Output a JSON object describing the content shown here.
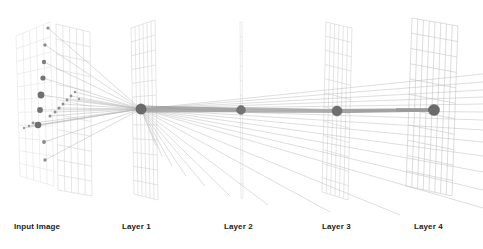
{
  "figure": {
    "background_color": "#ffffff",
    "width": 483,
    "height": 249
  },
  "style": {
    "grid_line_color_back": "#dddddd",
    "grid_line_color_front": "#cfcfcf",
    "grid_line_color_mid": "#c8c8c8",
    "ray_color": "#b4b4b4",
    "ray_color_strong": "#9a9a9a",
    "node_color": "#6e6e6e",
    "node_edge_color": "#555555",
    "dot_color_dark": "#6f6f6f",
    "dot_color_mid": "#8c8c8c",
    "dot_color_light": "#a8a8a8",
    "label_color": "#1b1b1b"
  },
  "labels": [
    {
      "id": "input-image",
      "text": "Input Image",
      "x": 14,
      "y": 222
    },
    {
      "id": "layer-1",
      "text": "Layer 1",
      "x": 122,
      "y": 222
    },
    {
      "id": "layer-2",
      "text": "Layer 2",
      "x": 224,
      "y": 222
    },
    {
      "id": "layer-3",
      "text": "Layer 3",
      "x": 322,
      "y": 222
    },
    {
      "id": "layer-4",
      "text": "Layer 4",
      "x": 414,
      "y": 222
    }
  ],
  "planes": [
    {
      "id": "input-plane-back",
      "name": "input-image-back-plane",
      "color": "#dedede",
      "stroke_width": 0.5,
      "cols": 5,
      "rows": 11,
      "top_left": [
        16,
        36
      ],
      "top_right": [
        50,
        22
      ],
      "bottom_right": [
        54,
        186
      ],
      "bottom_left": [
        20,
        176
      ]
    },
    {
      "id": "input-plane-front",
      "name": "input-image-front-plane",
      "color": "#d2d2d2",
      "stroke_width": 0.55,
      "cols": 5,
      "rows": 11,
      "top_left": [
        56,
        24
      ],
      "top_right": [
        90,
        32
      ],
      "bottom_right": [
        92,
        196
      ],
      "bottom_left": [
        58,
        190
      ]
    },
    {
      "id": "layer1-plane",
      "name": "layer-1-plane",
      "color": "#cdcdcd",
      "stroke_width": 0.5,
      "cols": 6,
      "rows": 12,
      "top_left": [
        131,
        28
      ],
      "top_right": [
        155,
        20
      ],
      "bottom_right": [
        158,
        200
      ],
      "bottom_left": [
        134,
        194
      ]
    },
    {
      "id": "layer2-plane",
      "name": "layer-2-plane",
      "color": "#d6d6d6",
      "stroke_width": 0.5,
      "cols": 1,
      "rows": 12,
      "top_left": [
        240,
        22
      ],
      "top_right": [
        242,
        22
      ],
      "bottom_right": [
        243,
        198
      ],
      "bottom_left": [
        241,
        198
      ]
    },
    {
      "id": "layer3-plane",
      "name": "layer-3-plane",
      "color": "#cbcbcb",
      "stroke_width": 0.5,
      "cols": 6,
      "rows": 12,
      "top_left": [
        326,
        22
      ],
      "top_right": [
        352,
        28
      ],
      "bottom_right": [
        348,
        200
      ],
      "bottom_left": [
        322,
        192
      ]
    },
    {
      "id": "layer4-plane",
      "name": "layer-4-plane",
      "color": "#c6c6c6",
      "stroke_width": 0.6,
      "cols": 8,
      "rows": 11,
      "top_left": [
        412,
        18
      ],
      "top_right": [
        458,
        26
      ],
      "bottom_right": [
        452,
        196
      ],
      "bottom_left": [
        406,
        186
      ]
    }
  ],
  "nodes": [
    {
      "id": "node-layer-1",
      "name": "layer-1-node",
      "x": 141,
      "y": 109,
      "r": 5.2,
      "color": "#6b6b6b"
    },
    {
      "id": "node-layer-2",
      "name": "layer-2-node",
      "x": 241,
      "y": 110,
      "r": 4.4,
      "color": "#737373"
    },
    {
      "id": "node-layer-3",
      "name": "layer-3-node",
      "x": 337,
      "y": 111,
      "r": 5.0,
      "color": "#6e6e6e"
    },
    {
      "id": "node-layer-4",
      "name": "layer-4-node",
      "x": 434,
      "y": 110,
      "r": 5.6,
      "color": "#6a6a6a"
    }
  ],
  "input_dots": [
    {
      "x": 48,
      "y": 28,
      "r": 1.6,
      "color": "#8c8c8c"
    },
    {
      "x": 45,
      "y": 45,
      "r": 1.7,
      "color": "#8c8c8c"
    },
    {
      "x": 44,
      "y": 62,
      "r": 2.2,
      "color": "#7d7d7d"
    },
    {
      "x": 43,
      "y": 78,
      "r": 2.6,
      "color": "#757575"
    },
    {
      "x": 41,
      "y": 95,
      "r": 3.4,
      "color": "#6f6f6f"
    },
    {
      "x": 40,
      "y": 110,
      "r": 2.9,
      "color": "#737373"
    },
    {
      "x": 38,
      "y": 125,
      "r": 3.3,
      "color": "#6f6f6f"
    },
    {
      "x": 44,
      "y": 142,
      "r": 1.9,
      "color": "#8a8a8a"
    },
    {
      "x": 45,
      "y": 160,
      "r": 1.7,
      "color": "#8f8f8f"
    },
    {
      "x": 24,
      "y": 128,
      "r": 1.2,
      "color": "#9d9d9d"
    },
    {
      "x": 29,
      "y": 126,
      "r": 1.3,
      "color": "#999999"
    },
    {
      "x": 33,
      "y": 123,
      "r": 1.4,
      "color": "#959595"
    },
    {
      "x": 50,
      "y": 116,
      "r": 1.5,
      "color": "#909090"
    },
    {
      "x": 55,
      "y": 112,
      "r": 1.5,
      "color": "#909090"
    },
    {
      "x": 59,
      "y": 108,
      "r": 1.6,
      "color": "#8b8b8b"
    },
    {
      "x": 63,
      "y": 104,
      "r": 1.5,
      "color": "#909090"
    },
    {
      "x": 67,
      "y": 100,
      "r": 1.4,
      "color": "#959595"
    },
    {
      "x": 71,
      "y": 96,
      "r": 1.4,
      "color": "#959595"
    },
    {
      "x": 75,
      "y": 92,
      "r": 1.3,
      "color": "#9a9a9a"
    },
    {
      "x": 79,
      "y": 99,
      "r": 1.2,
      "color": "#9d9d9d"
    }
  ],
  "ray_bundles": [
    {
      "id": "input-to-layer1",
      "name": "rays-input-to-layer-1",
      "target": [
        141,
        109
      ],
      "color": "#b0b0b0",
      "stroke_width": 0.45
    },
    {
      "id": "layer1-fan",
      "name": "rays-layer-1-fan",
      "source": [
        141,
        109
      ],
      "color": "#b6b6b6",
      "stroke_width": 0.45,
      "endpoints": [
        [
          483,
          74
        ],
        [
          483,
          82
        ],
        [
          483,
          90
        ],
        [
          483,
          97
        ],
        [
          483,
          104
        ],
        [
          483,
          112
        ],
        [
          483,
          120
        ],
        [
          483,
          130
        ],
        [
          483,
          142
        ],
        [
          483,
          156
        ],
        [
          483,
          172
        ],
        [
          483,
          190
        ],
        [
          483,
          208
        ],
        [
          400,
          215
        ],
        [
          330,
          212
        ],
        [
          268,
          205
        ],
        [
          230,
          196
        ],
        [
          205,
          186
        ],
        [
          186,
          176
        ],
        [
          172,
          166
        ],
        [
          162,
          156
        ],
        [
          156,
          146
        ]
      ]
    },
    {
      "id": "layer2-to-layer3",
      "name": "rays-layer-2-to-layer-3",
      "source": [
        241,
        110
      ],
      "target": [
        337,
        111
      ],
      "color": "#a5a5a5",
      "stroke_width": 0.8
    },
    {
      "id": "layer3-to-layer4",
      "name": "rays-layer-3-to-layer-4",
      "source": [
        337,
        111
      ],
      "target": [
        434,
        110
      ],
      "color": "#a0a0a0",
      "stroke_width": 1.0
    },
    {
      "id": "layer1-to-layer2",
      "name": "rays-layer-1-to-layer-2",
      "source": [
        141,
        109
      ],
      "target": [
        241,
        110
      ],
      "color": "#9e9e9e",
      "stroke_width": 0.9
    },
    {
      "id": "layer4-inlet",
      "name": "rays-into-layer-4",
      "source": [
        396,
        110
      ],
      "target": [
        434,
        110
      ],
      "color": "#9a9a9a",
      "stroke_width": 1.2
    }
  ]
}
